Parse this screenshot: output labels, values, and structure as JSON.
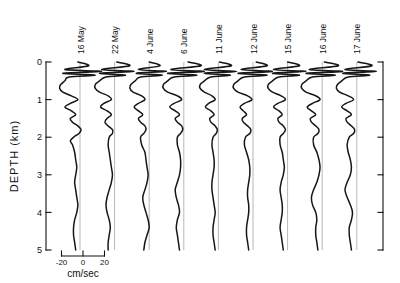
{
  "chart_data": {
    "type": "line",
    "title": "",
    "subtitle": "",
    "orientation": "vertical-profiles",
    "xlabel": "cm/sec",
    "ylabel": "DEPTH (km)",
    "ylim": [
      0,
      5
    ],
    "y_ticks": [
      "0",
      "1",
      "2",
      "3",
      "4",
      "5"
    ],
    "y_tick_values": [
      0,
      1,
      2,
      3,
      4,
      5
    ],
    "xlim": [
      -20,
      20
    ],
    "x_ticks": [
      "-20",
      "0",
      "20"
    ],
    "x_tick_values": [
      -20,
      0,
      20
    ],
    "grid": false,
    "legend": "none",
    "scale_bar": {
      "label": "cm/sec",
      "ticks": [
        "-20",
        "0",
        "20"
      ],
      "span_units": 40
    },
    "right_axis": {
      "present": true,
      "ticks_unlabeled": [
        0,
        1,
        2,
        3,
        4,
        5
      ]
    },
    "series": [
      {
        "name": "16 May",
        "depths": [
          0.0,
          0.1,
          0.2,
          0.25,
          0.3,
          0.35,
          0.4,
          0.5,
          0.6,
          0.7,
          0.8,
          0.9,
          1.0,
          1.1,
          1.2,
          1.3,
          1.4,
          1.5,
          1.6,
          1.7,
          1.8,
          1.9,
          2.0,
          2.1,
          2.2,
          2.4,
          2.6,
          2.8,
          3.0,
          3.2,
          3.4,
          3.6,
          3.8,
          4.0,
          4.2,
          4.4,
          4.6,
          4.8,
          5.0
        ],
        "values": [
          -2,
          8,
          -14,
          20,
          -16,
          14,
          -10,
          -14,
          -18,
          -19,
          -16,
          -8,
          -2,
          -9,
          -14,
          -8,
          -4,
          -9,
          -7,
          -2,
          1,
          -1,
          -6,
          -9,
          -7,
          -5,
          -4,
          -3,
          -4,
          -5,
          -4,
          -3,
          -2,
          -3,
          -5,
          -6,
          -6,
          -5,
          -4
        ]
      },
      {
        "name": "22 May",
        "depths": [
          0.0,
          0.1,
          0.2,
          0.25,
          0.3,
          0.35,
          0.4,
          0.5,
          0.6,
          0.7,
          0.8,
          0.9,
          1.0,
          1.1,
          1.2,
          1.3,
          1.4,
          1.5,
          1.6,
          1.7,
          1.8,
          1.9,
          2.0,
          2.2,
          2.4,
          2.6,
          2.8,
          3.0,
          3.2,
          3.4,
          3.6,
          3.8,
          4.0,
          4.2,
          4.4,
          4.6,
          4.8,
          5.0
        ],
        "values": [
          2,
          14,
          -12,
          18,
          -14,
          10,
          -8,
          -14,
          -18,
          -18,
          -14,
          -6,
          -3,
          -10,
          -13,
          -7,
          -3,
          -7,
          -9,
          -6,
          -2,
          -2,
          -5,
          -6,
          -5,
          -4,
          -3,
          -2,
          -3,
          -5,
          -7,
          -8,
          -7,
          -5,
          -4,
          -5,
          -6,
          -6
        ]
      },
      {
        "name": "4 June",
        "depths": [
          0.0,
          0.1,
          0.2,
          0.25,
          0.3,
          0.35,
          0.4,
          0.5,
          0.6,
          0.7,
          0.8,
          0.9,
          1.0,
          1.1,
          1.2,
          1.3,
          1.4,
          1.5,
          1.6,
          1.7,
          1.8,
          1.9,
          2.0,
          2.2,
          2.4,
          2.6,
          2.8,
          3.0,
          3.2,
          3.4,
          3.6,
          3.8,
          4.0,
          4.2,
          4.4,
          4.6,
          4.8,
          5.0
        ],
        "values": [
          0,
          10,
          -10,
          16,
          -12,
          12,
          -8,
          -13,
          -17,
          -18,
          -15,
          -7,
          -4,
          -10,
          -14,
          -10,
          -6,
          -10,
          -8,
          -4,
          -3,
          -5,
          -8,
          -7,
          -4,
          -3,
          -2,
          -1,
          -2,
          -4,
          -6,
          -5,
          -3,
          -1,
          0,
          -2,
          -4,
          -5
        ]
      },
      {
        "name": "6 June",
        "depths": [
          0.0,
          0.1,
          0.2,
          0.25,
          0.3,
          0.35,
          0.4,
          0.5,
          0.6,
          0.7,
          0.8,
          0.9,
          1.0,
          1.1,
          1.2,
          1.3,
          1.4,
          1.5,
          1.6,
          1.7,
          1.8,
          1.9,
          2.0,
          2.2,
          2.4,
          2.6,
          2.8,
          3.0,
          3.2,
          3.4,
          3.6,
          3.8,
          4.0,
          4.2,
          4.4,
          4.6,
          4.8,
          5.0
        ],
        "values": [
          4,
          16,
          -12,
          19,
          -15,
          12,
          -9,
          -15,
          -19,
          -19,
          -15,
          -6,
          -2,
          -9,
          -13,
          -8,
          -4,
          -8,
          -6,
          -2,
          -1,
          -3,
          -6,
          -6,
          -4,
          -3,
          -3,
          -4,
          -6,
          -8,
          -7,
          -5,
          -4,
          -6,
          -7,
          -6,
          -5,
          -4
        ]
      },
      {
        "name": "11 June",
        "depths": [
          0.0,
          0.1,
          0.2,
          0.25,
          0.3,
          0.35,
          0.4,
          0.5,
          0.6,
          0.7,
          0.8,
          0.9,
          1.0,
          1.1,
          1.2,
          1.3,
          1.4,
          1.5,
          1.6,
          1.7,
          1.8,
          1.9,
          2.0,
          2.2,
          2.4,
          2.6,
          2.8,
          3.0,
          3.2,
          3.4,
          3.6,
          3.8,
          4.0,
          4.2,
          4.4,
          4.6,
          4.8,
          5.0
        ],
        "values": [
          1,
          12,
          -13,
          17,
          -13,
          11,
          -7,
          -13,
          -17,
          -17,
          -13,
          -6,
          -3,
          -9,
          -12,
          -7,
          -4,
          -8,
          -7,
          -3,
          -1,
          -2,
          -5,
          -6,
          -5,
          -4,
          -4,
          -5,
          -6,
          -6,
          -5,
          -4,
          -3,
          -4,
          -5,
          -5,
          -4,
          -3
        ]
      },
      {
        "name": "12 June",
        "depths": [
          0.0,
          0.1,
          0.2,
          0.25,
          0.3,
          0.35,
          0.4,
          0.5,
          0.6,
          0.7,
          0.8,
          0.9,
          1.0,
          1.1,
          1.2,
          1.3,
          1.4,
          1.5,
          1.6,
          1.7,
          1.8,
          1.9,
          2.0,
          2.2,
          2.4,
          2.6,
          2.8,
          3.0,
          3.2,
          3.4,
          3.6,
          3.8,
          4.0,
          4.2,
          4.4,
          4.6,
          4.8,
          5.0
        ],
        "values": [
          3,
          13,
          -11,
          18,
          -14,
          13,
          -8,
          -14,
          -18,
          -18,
          -14,
          -5,
          -1,
          -8,
          -12,
          -9,
          -6,
          -10,
          -9,
          -5,
          -2,
          -3,
          -7,
          -8,
          -6,
          -4,
          -3,
          -3,
          -4,
          -5,
          -5,
          -4,
          -4,
          -5,
          -6,
          -6,
          -5,
          -4
        ]
      },
      {
        "name": "15 June",
        "depths": [
          0.0,
          0.1,
          0.2,
          0.25,
          0.3,
          0.35,
          0.4,
          0.5,
          0.6,
          0.7,
          0.8,
          0.9,
          1.0,
          1.1,
          1.2,
          1.3,
          1.4,
          1.5,
          1.6,
          1.7,
          1.8,
          1.9,
          2.0,
          2.2,
          2.4,
          2.6,
          2.8,
          3.0,
          3.2,
          3.4,
          3.6,
          3.8,
          4.0,
          4.2,
          4.4,
          4.6,
          4.8,
          5.0
        ],
        "values": [
          0,
          11,
          -13,
          17,
          -14,
          11,
          -8,
          -14,
          -18,
          -18,
          -14,
          -6,
          -2,
          -9,
          -13,
          -8,
          -5,
          -9,
          -8,
          -4,
          -2,
          -4,
          -7,
          -7,
          -5,
          -4,
          -3,
          -4,
          -6,
          -7,
          -6,
          -5,
          -5,
          -6,
          -7,
          -6,
          -5,
          -4
        ]
      },
      {
        "name": "16 June",
        "depths": [
          0.0,
          0.1,
          0.2,
          0.25,
          0.3,
          0.35,
          0.4,
          0.5,
          0.6,
          0.7,
          0.8,
          0.9,
          1.0,
          1.1,
          1.2,
          1.3,
          1.4,
          1.5,
          1.6,
          1.7,
          1.8,
          1.9,
          2.0,
          2.2,
          2.4,
          2.6,
          2.8,
          3.0,
          3.2,
          3.4,
          3.6,
          3.8,
          4.0,
          4.2,
          4.4,
          4.6,
          4.8,
          5.0
        ],
        "values": [
          2,
          15,
          -12,
          19,
          -15,
          12,
          -9,
          -15,
          -19,
          -19,
          -15,
          -6,
          -2,
          -9,
          -14,
          -10,
          -6,
          -11,
          -10,
          -6,
          -3,
          -4,
          -8,
          -8,
          -5,
          -3,
          -2,
          -3,
          -5,
          -8,
          -10,
          -9,
          -6,
          -5,
          -6,
          -6,
          -5,
          -4
        ]
      },
      {
        "name": "17 June",
        "depths": [
          0.0,
          0.1,
          0.2,
          0.25,
          0.3,
          0.35,
          0.4,
          0.5,
          0.6,
          0.7,
          0.8,
          0.9,
          1.0,
          1.1,
          1.2,
          1.3,
          1.4,
          1.5,
          1.6,
          1.7,
          1.8,
          1.9,
          2.0,
          2.2,
          2.4,
          2.6,
          2.8,
          3.0,
          3.2,
          3.4,
          3.6,
          3.8,
          4.0,
          4.2,
          4.4,
          4.6,
          4.8,
          5.0
        ],
        "values": [
          1,
          14,
          -11,
          18,
          -13,
          12,
          -8,
          -14,
          -18,
          -19,
          -16,
          -8,
          -3,
          -10,
          -14,
          -9,
          -5,
          -10,
          -9,
          -5,
          -2,
          -3,
          -7,
          -9,
          -8,
          -6,
          -5,
          -6,
          -9,
          -11,
          -9,
          -6,
          -4,
          -5,
          -7,
          -7,
          -6,
          -5
        ]
      }
    ]
  },
  "axes": {
    "depth_title": "DEPTH (km)",
    "depth_ticks": [
      "0",
      "1",
      "2",
      "3",
      "4",
      "5"
    ]
  },
  "scale": {
    "left_tick": "-20",
    "mid_tick": "0",
    "right_tick": "20",
    "unit": "cm/sec"
  },
  "columns": [
    {
      "label": "16 May"
    },
    {
      "label": "22 May"
    },
    {
      "label": "4 June"
    },
    {
      "label": "6 June"
    },
    {
      "label": "11 June"
    },
    {
      "label": "12 June"
    },
    {
      "label": "15 June"
    },
    {
      "label": "16 June"
    },
    {
      "label": "17 June"
    }
  ],
  "colors": {
    "curve": "#161616",
    "axis": "#111111",
    "zero_line": "#9a9a9a",
    "background": "#ffffff"
  }
}
